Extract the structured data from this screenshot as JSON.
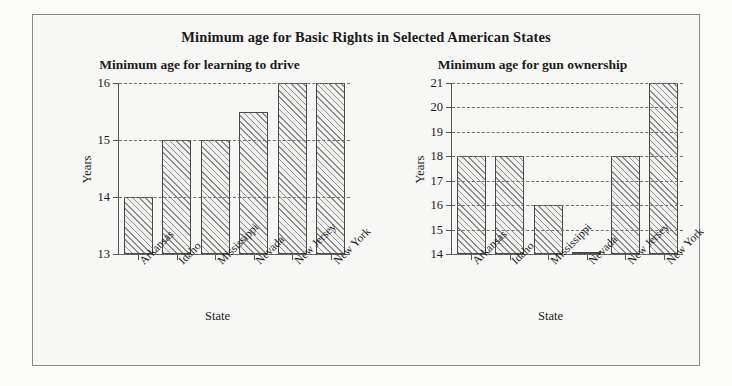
{
  "figure": {
    "main_title": "Minimum age for Basic Rights in Selected American States",
    "background_color": "#f7f7f6",
    "border_color": "#8a8a8a",
    "bar_edge_color": "#4a4a4a",
    "hatch_color": "#8e8e8e",
    "grid_color": "#6f6f6f"
  },
  "chart_data": [
    {
      "type": "bar",
      "title": "Minimum age for learning to drive",
      "xlabel": "State",
      "ylabel": "Years",
      "categories": [
        "Arkansas",
        "Idaho",
        "Mississippi",
        "Nevada",
        "New Jersey",
        "New York"
      ],
      "values": [
        14,
        15,
        15,
        15.5,
        16,
        16
      ],
      "yticks": [
        13,
        14,
        15,
        16
      ],
      "ytick_labels": [
        "13",
        "14",
        "15",
        "16"
      ],
      "ylim": [
        13,
        16
      ],
      "grid": true,
      "legend": "none"
    },
    {
      "type": "bar",
      "title": "Minimum age for gun ownership",
      "xlabel": "State",
      "ylabel": "Years",
      "categories": [
        "Arkansas",
        "Idaho",
        "Mississippi",
        "Nevada",
        "New Jersey",
        "New York"
      ],
      "values": [
        18,
        18,
        16,
        14.1,
        18,
        21
      ],
      "yticks": [
        14,
        15,
        16,
        17,
        18,
        19,
        20,
        21
      ],
      "ytick_labels": [
        "14",
        "15",
        "16",
        "17",
        "18",
        "19",
        "20",
        "21"
      ],
      "ylim": [
        14,
        21
      ],
      "grid": true,
      "legend": "none"
    }
  ]
}
